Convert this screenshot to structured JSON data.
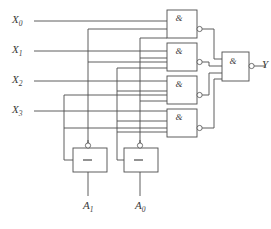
{
  "diagram": {
    "style": {
      "line_color": "#4d4d4d",
      "text_color": "#3a3a3a",
      "background": "#ffffff"
    },
    "inputs": [
      {
        "id": "x0",
        "label": "X",
        "subscript": "0",
        "x": 14,
        "y": 15,
        "wire_y": 21
      },
      {
        "id": "x1",
        "label": "X",
        "subscript": "1",
        "x": 14,
        "y": 45,
        "wire_y": 51
      },
      {
        "id": "x2",
        "label": "X",
        "subscript": "2",
        "x": 14,
        "y": 75,
        "wire_y": 81
      },
      {
        "id": "x3",
        "label": "X",
        "subscript": "3",
        "x": 14,
        "y": 105,
        "wire_y": 111
      }
    ],
    "selects": [
      {
        "id": "a1",
        "label": "A",
        "subscript": "1",
        "x": 82,
        "y": 207
      },
      {
        "id": "a0",
        "label": "A",
        "subscript": "0",
        "x": 134,
        "y": 207
      }
    ],
    "output": {
      "id": "y",
      "label": "Y",
      "x": 259,
      "y": 66
    },
    "and_gates": [
      {
        "id": "and1",
        "glyph": "&",
        "x": 167,
        "y": 10,
        "w": 30,
        "h": 28,
        "inverted": true
      },
      {
        "id": "and2",
        "glyph": "&",
        "x": 167,
        "y": 43,
        "w": 30,
        "h": 28,
        "inverted": true
      },
      {
        "id": "and3",
        "glyph": "&",
        "x": 167,
        "y": 76,
        "w": 30,
        "h": 28,
        "inverted": true
      },
      {
        "id": "and4",
        "glyph": "&",
        "x": 167,
        "y": 109,
        "w": 30,
        "h": 28,
        "inverted": true
      }
    ],
    "output_gate": {
      "id": "andout",
      "glyph": "&",
      "x": 222,
      "y": 52,
      "w": 27,
      "h": 29,
      "inverted": true
    },
    "inverters": [
      {
        "id": "inv-a1",
        "glyph": "—",
        "x": 73,
        "y": 148,
        "w": 34,
        "h": 24,
        "inverted": true
      },
      {
        "id": "inv-a0",
        "glyph": "—",
        "x": 124,
        "y": 148,
        "w": 34,
        "h": 24,
        "inverted": true
      }
    ]
  }
}
